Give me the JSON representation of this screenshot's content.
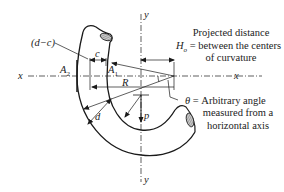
{
  "labels": {
    "d_minus_c": "(d−c)",
    "c": "c",
    "A2": "A",
    "A2_sub": "2",
    "A1": "A",
    "A1_sub": "1",
    "R": "R",
    "d": "d",
    "p": "p",
    "x_left": "x",
    "x_right": "x",
    "y_top": "y",
    "y_bottom": "y",
    "H0": "H",
    "H0_sub": "o",
    "eq1": "=",
    "theta": "θ",
    "eq2": "="
  },
  "annotations": {
    "projected_line1": "Projected distance",
    "projected_line2": "between the centers",
    "projected_line3": "of curvature",
    "theta_line1": "Arbitrary angle",
    "theta_line2": "measured from a",
    "theta_line3": "horizontal axis"
  },
  "colors": {
    "stroke": "#1a1a1a",
    "hatch": "#888888",
    "background": "#ffffff"
  }
}
